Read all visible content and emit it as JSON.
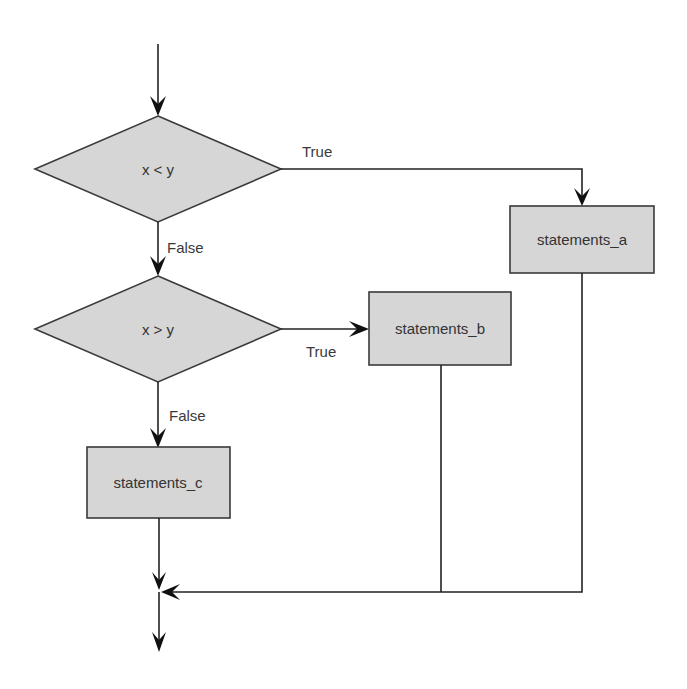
{
  "diagram": {
    "type": "flowchart",
    "colors": {
      "background": "#ffffff",
      "node_fill": "#d6d6d6",
      "node_stroke": "#3a3a3a",
      "edge": "#222222",
      "text": "#333333"
    },
    "nodes": {
      "decision_1": {
        "label": "x < y",
        "shape": "diamond"
      },
      "decision_2": {
        "label": "x > y",
        "shape": "diamond"
      },
      "statements_a": {
        "label": "statements_a",
        "shape": "rectangle"
      },
      "statements_b": {
        "label": "statements_b",
        "shape": "rectangle"
      },
      "statements_c": {
        "label": "statements_c",
        "shape": "rectangle"
      }
    },
    "edges": {
      "d1_true": {
        "from": "decision_1",
        "to": "statements_a",
        "label": "True"
      },
      "d1_false": {
        "from": "decision_1",
        "to": "decision_2",
        "label": "False"
      },
      "d2_true": {
        "from": "decision_2",
        "to": "statements_b",
        "label": "True"
      },
      "d2_false": {
        "from": "decision_2",
        "to": "statements_c",
        "label": "False"
      }
    }
  }
}
